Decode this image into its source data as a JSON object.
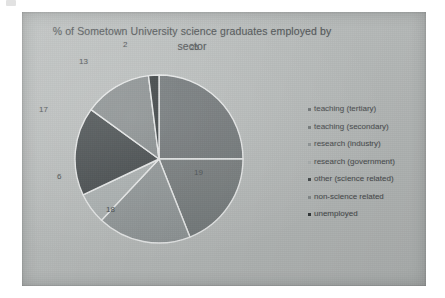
{
  "chart_data": {
    "type": "pie",
    "title": "% of Sometown University science graduates employed by sector",
    "title_line1": "% of Sometown University science graduates employed by",
    "title_line2": "sector",
    "xlabel": "",
    "ylabel": "",
    "legend_position": "right",
    "grid": false,
    "units": "%",
    "total": 100,
    "categories": [
      "teaching (tertiary)",
      "teaching (secondary)",
      "research (industry)",
      "research (government)",
      "other (science related)",
      "non-science related",
      "unemployed"
    ],
    "values": [
      25,
      19,
      18,
      6,
      17,
      13,
      2
    ],
    "colors": [
      "#6d7375",
      "#73797a",
      "#8e9495",
      "#a9afaf",
      "#3e4446",
      "#858b8c",
      "#2f3537"
    ],
    "slices": [
      {
        "label": "teaching (tertiary)",
        "value": 25,
        "data_label": "25",
        "color": "#6d7375"
      },
      {
        "label": "teaching (secondary)",
        "value": 19,
        "data_label": "19",
        "color": "#73797a"
      },
      {
        "label": "research (industry)",
        "value": 18,
        "data_label": "18",
        "color": "#8e9495"
      },
      {
        "label": "research (government)",
        "value": 6,
        "data_label": "6",
        "color": "#a9afaf"
      },
      {
        "label": "other (science related)",
        "value": 17,
        "data_label": "17",
        "color": "#3e4446"
      },
      {
        "label": "non-science related",
        "value": 13,
        "data_label": "13",
        "color": "#858b8c"
      },
      {
        "label": "unemployed",
        "value": 2,
        "data_label": "2",
        "color": "#2f3537"
      }
    ]
  },
  "chart": {
    "background_color": "#b7bbba",
    "slice_border_color": "#e8eaea",
    "label_color": "#43484a",
    "title_color": "#4a4e50"
  },
  "data_labels": {
    "l0": "25",
    "l1": "19",
    "l2": "18",
    "l3": "6",
    "l4": "17",
    "l5": "13",
    "l6": "2"
  }
}
